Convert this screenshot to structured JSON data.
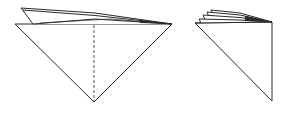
{
  "diagram": {
    "type": "origami-fold-steps",
    "stroke_color": "#2a2a2a",
    "background": "#ffffff",
    "figures": [
      {
        "id": "step-left",
        "description": "Inverted triangle with stacked flaps on top and a dashed vertical fold line",
        "main_triangle": {
          "points": [
            [
              15,
              24
            ],
            [
              172,
              24
            ],
            [
              94,
              102
            ]
          ]
        },
        "fold_line": {
          "style": "dashed",
          "from": [
            94,
            24
          ],
          "to": [
            94,
            102
          ]
        },
        "flaps": [
          {
            "points": [
              [
                21,
                8
              ],
              [
                172,
                24
              ],
              [
                33,
                24
              ]
            ]
          },
          {
            "points": [
              [
                21,
                8
              ],
              [
                95,
                13
              ],
              [
                172,
                24
              ]
            ]
          },
          {
            "points": [
              [
                33,
                24
              ],
              [
                95,
                19
              ],
              [
                172,
                24
              ]
            ]
          }
        ]
      },
      {
        "id": "step-right",
        "description": "Half-folded right triangle with several stacked layered flaps at top",
        "main_triangle": {
          "points": [
            [
              195,
              23
            ],
            [
              272,
              22
            ],
            [
              272,
              101
            ]
          ]
        },
        "flaps": [
          {
            "points": [
              [
                199,
                19
              ],
              [
                272,
                22
              ]
            ]
          },
          {
            "points": [
              [
                203,
                15
              ],
              [
                272,
                22
              ]
            ]
          },
          {
            "points": [
              [
                207,
                12
              ],
              [
                272,
                22
              ]
            ]
          },
          {
            "points": [
              [
                211,
                10
              ],
              [
                272,
                22
              ]
            ]
          }
        ]
      }
    ]
  }
}
